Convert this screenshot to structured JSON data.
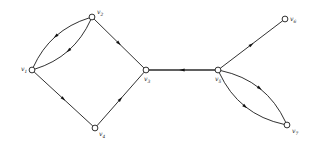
{
  "figure": {
    "kind": "directed-multigraph",
    "background_color": "#ffffff",
    "stroke_color": "#1a1a1a",
    "arrow_color": "#111111",
    "node_fill": "#ffffff"
  },
  "nodes": [
    {
      "id": "v1",
      "label": "v",
      "sub": "1",
      "x": 32,
      "y": 70,
      "label_dx": -11,
      "label_dy": 1
    },
    {
      "id": "v2",
      "label": "v",
      "sub": "2",
      "x": 92,
      "y": 17,
      "label_dx": 5,
      "label_dy": -3
    },
    {
      "id": "v3",
      "label": "v",
      "sub": "3",
      "x": 146,
      "y": 70,
      "label_dx": -2,
      "label_dy": 11
    },
    {
      "id": "v4",
      "label": "v",
      "sub": "4",
      "x": 95,
      "y": 128,
      "label_dx": 4,
      "label_dy": 8
    },
    {
      "id": "v5",
      "label": "v",
      "sub": "5",
      "x": 218,
      "y": 70,
      "label_dx": -3,
      "label_dy": 11
    },
    {
      "id": "v6",
      "label": "v",
      "sub": "6",
      "x": 285,
      "y": 19,
      "label_dx": 5,
      "label_dy": 2
    },
    {
      "id": "v7",
      "label": "v",
      "sub": "7",
      "x": 287,
      "y": 125,
      "label_dx": 5,
      "label_dy": 8
    }
  ],
  "edges": [
    {
      "id": "e1",
      "from": "v2",
      "to": "v1",
      "shape": "curve",
      "bow": 9,
      "style": "thin",
      "note": "upper arc of v1-v2 bigon, arrow toward v1"
    },
    {
      "id": "e2",
      "from": "v2",
      "to": "v1",
      "shape": "curve",
      "bow": -9,
      "style": "thin",
      "note": "lower arc of v1-v2 bigon, arrow toward v1"
    },
    {
      "id": "e3",
      "from": "v1",
      "to": "v4",
      "shape": "line",
      "bow": 0,
      "style": "thin",
      "note": "arrow toward v4"
    },
    {
      "id": "e4",
      "from": "v4",
      "to": "v3",
      "shape": "line",
      "bow": 0,
      "style": "thin",
      "note": "arrow toward v3"
    },
    {
      "id": "e5",
      "from": "v2",
      "to": "v3",
      "shape": "line",
      "bow": 0,
      "style": "thin",
      "note": "arrow toward v3"
    },
    {
      "id": "e6",
      "from": "v5",
      "to": "v3",
      "shape": "line",
      "bow": 0,
      "style": "thick",
      "note": "horizontal bridge, arrow toward v3"
    },
    {
      "id": "e7",
      "from": "v5",
      "to": "v6",
      "shape": "line",
      "bow": 0,
      "style": "thin",
      "note": "arrow toward v6"
    },
    {
      "id": "e8",
      "from": "v5",
      "to": "v7",
      "shape": "curve",
      "bow": 11,
      "style": "thin",
      "note": "left arc of v5-v7 bigon, arrow toward v7"
    },
    {
      "id": "e9",
      "from": "v5",
      "to": "v7",
      "shape": "curve",
      "bow": -11,
      "style": "thin",
      "note": "right arc of v5-v7 bigon, arrow toward v7"
    }
  ],
  "geometry": {
    "node_radius": 2.9,
    "arrow_length": 5.2,
    "arrow_width": 3.0,
    "arrow_position": 0.5
  }
}
